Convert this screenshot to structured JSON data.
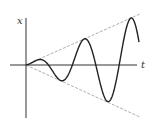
{
  "diagram": {
    "title": "",
    "axes": {
      "x_label": "t",
      "y_label": "x"
    },
    "curve": {
      "type": "t*sin(t)",
      "color": "#222222",
      "half_cycles": 5
    },
    "envelope": {
      "color": "#888888",
      "upper": "x = +k t",
      "lower": "x = -k t"
    }
  }
}
